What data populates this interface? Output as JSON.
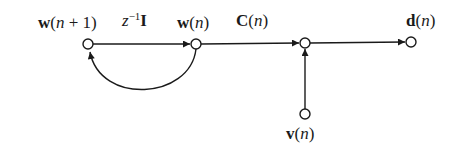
{
  "diagram": {
    "type": "signal-flow-graph",
    "nodes": [
      {
        "id": "w_next",
        "label_bold": "w",
        "label_arg": "n + 1",
        "x": 88,
        "y": 44
      },
      {
        "id": "w",
        "label_bold": "w",
        "label_arg": "n",
        "x": 196,
        "y": 44
      },
      {
        "id": "sum",
        "x": 305,
        "y": 43
      },
      {
        "id": "d",
        "label_bold": "d",
        "label_arg": "n",
        "x": 411,
        "y": 42
      },
      {
        "id": "v",
        "label_bold": "v",
        "label_arg": "n",
        "x": 305,
        "y": 114
      }
    ],
    "edges": [
      {
        "from": "w_next",
        "to": "w",
        "gain": "z^-1 I"
      },
      {
        "from": "w",
        "to": "sum",
        "gain": "C(n)"
      },
      {
        "from": "sum",
        "to": "d"
      },
      {
        "from": "v",
        "to": "sum"
      },
      {
        "from": "w",
        "to": "w_next",
        "kind": "feedback-arc"
      }
    ],
    "labels": {
      "w_next": {
        "bold": "w",
        "open": "(",
        "arg": "n",
        "rest": " + 1)"
      },
      "z": {
        "z": "z",
        "exp": "−1",
        "bold": "I"
      },
      "w": {
        "bold": "w",
        "open": "(",
        "arg": "n",
        "close": ")"
      },
      "C": {
        "bold": "C",
        "open": "(",
        "arg": "n",
        "close": ")"
      },
      "d": {
        "bold": "d",
        "open": "(",
        "arg": "n",
        "close": ")"
      },
      "v": {
        "bold": "v",
        "open": "(",
        "arg": "n",
        "close": ")"
      }
    },
    "colors": {
      "line": "#1a1a1a",
      "background": "#ffffff"
    }
  }
}
